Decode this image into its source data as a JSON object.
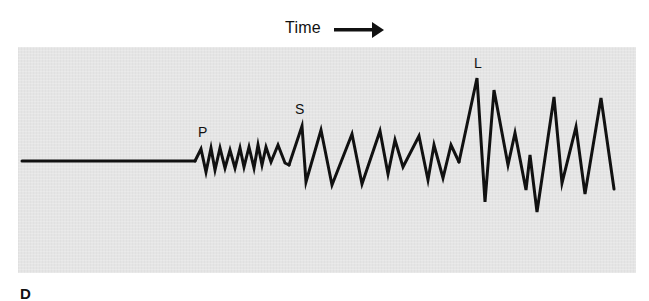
{
  "figure": {
    "panel_letter": "D",
    "time_axis": {
      "label": "Time",
      "arrow_icon": "right-arrow-icon"
    },
    "background_color": "#e5e5e5",
    "trace_color": "#111111",
    "wave_labels": {
      "p": "P",
      "s": "S",
      "l": "L"
    },
    "phases": [
      {
        "name": "quiet",
        "description": "flat baseline before arrival"
      },
      {
        "name": "P",
        "description": "primary waves: small, high-frequency oscillations"
      },
      {
        "name": "S",
        "description": "secondary waves: larger amplitude, lower frequency"
      },
      {
        "name": "L",
        "description": "surface (long) waves: largest amplitude"
      }
    ]
  }
}
